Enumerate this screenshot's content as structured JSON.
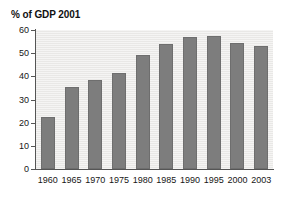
{
  "chart_data": {
    "type": "bar",
    "title": "% of GDP 2001",
    "xlabel": "",
    "ylabel": "",
    "ylim": [
      0,
      60
    ],
    "yticks": [
      0,
      10,
      20,
      30,
      40,
      50,
      60
    ],
    "grid": false,
    "legend": "none",
    "categories": [
      "1960",
      "1965",
      "1970",
      "1975",
      "1980",
      "1985",
      "1990",
      "1995",
      "2000",
      "2003"
    ],
    "values": [
      22.5,
      35.4,
      38.5,
      41.4,
      49.3,
      54.0,
      57.0,
      57.3,
      54.5,
      53.0
    ],
    "series": [
      {
        "name": "% of GDP",
        "values": [
          22.5,
          35.4,
          38.5,
          41.4,
          49.3,
          54.0,
          57.0,
          57.3,
          54.5,
          53.0
        ]
      }
    ],
    "colors": {
      "bar": "#7d7d7d",
      "bar_border": "#6e6e6e",
      "plot_background": "#e9e8e6",
      "page_background": "#ffffff",
      "axis": "#555555",
      "text": "#161616"
    }
  }
}
